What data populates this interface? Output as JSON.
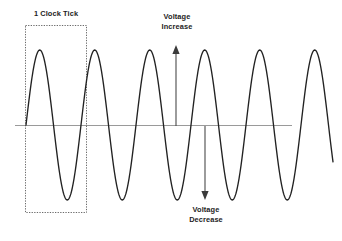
{
  "figure": {
    "background_color": "#ffffff",
    "wave_color": "#222222",
    "axis_color": "#9a9a9a",
    "box_color": "#6b6b6b",
    "arrow_color": "#4a4a4a"
  },
  "labels": {
    "clock_tick": "1 Clock Tick",
    "voltage_increase_line1": "Voltage",
    "voltage_increase_line2": "Increase",
    "voltage_decrease_line1": "Voltage",
    "voltage_decrease_line2": "Decrease"
  },
  "chart_data": {
    "type": "line",
    "title": "",
    "subtitle": "",
    "xlabel": "",
    "ylabel": "",
    "grid": false,
    "legend": "none",
    "waveform": {
      "shape": "sine",
      "baseline_y": 125,
      "amplitude_px": 75,
      "peak_y": 50,
      "trough_y": 200,
      "period_px": 55,
      "start_x": 26,
      "end_x": 333,
      "cycles_visible": 5.6,
      "peaks_x": [
        42,
        97,
        152,
        207,
        262,
        317
      ],
      "troughs_x": [
        70,
        125,
        180,
        235,
        290
      ]
    },
    "baseline": {
      "name": "zero-voltage-axis",
      "x_start": 15,
      "x_end": 292,
      "y": 125,
      "style": "solid-thin-gray"
    },
    "annotations": [
      {
        "name": "clock-tick-box",
        "type": "dotted-rectangle",
        "label": "1 Clock Tick",
        "x": 25,
        "y": 25,
        "width": 61,
        "height": 187,
        "spans": "one full waveform cycle"
      },
      {
        "name": "voltage-increase-arrow",
        "type": "arrow",
        "direction": "up",
        "label": "Voltage Increase",
        "x": 176,
        "y_tail": 126,
        "y_head": 46
      },
      {
        "name": "voltage-decrease-arrow",
        "type": "arrow",
        "direction": "down",
        "label": "Voltage Decrease",
        "x": 205,
        "y_tail": 126,
        "y_head": 199
      }
    ]
  }
}
